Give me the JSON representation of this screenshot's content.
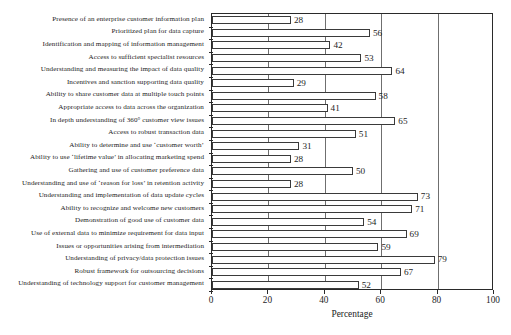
{
  "chart_data": {
    "type": "bar",
    "orientation": "horizontal",
    "title": "",
    "xlabel": "Percentage",
    "ylabel": "",
    "xlim": [
      0,
      100
    ],
    "xticks": [
      0,
      20,
      40,
      60,
      80,
      100
    ],
    "grid": true,
    "gridlines_at": [
      20,
      40,
      60,
      80
    ],
    "legend": false,
    "bar_style": {
      "fill": "#ffffff",
      "edge": "#3a3a3a"
    },
    "data_labels": true,
    "categories": [
      "Presence of an enterprise customer information plan",
      "Prioritized plan for data capture",
      "Identification and mapping of information management",
      "Access to sufficient specialist resources",
      "Understanding and measuring the impact of data quality",
      "Incentives and sanction supporting data quality",
      "Ability to share customer data at multiple touch points",
      "Appropriate access to data across the organization",
      "In depth understanding of 360° customer view issues",
      "Access to robust transaction data",
      "Ability to determine and use ‘customer worth’",
      "Ability to use ‘lifetime value’ in allocating marketing spend",
      "Gathering and use of customer preference data",
      "Understanding and use of ‘reason for loss’ in retention activity",
      "Understanding and implementation of data update cycles",
      "Ability to recognize and welcome new customers",
      "Demonstration of good use of customer data",
      "Use of external data to minimize requirement for data input",
      "Issues or opportunities arising from intermediation",
      "Understanding of privacy/data protection issues",
      "Robust framework for outsourcing decisions",
      "Understanding of technology support for customer management"
    ],
    "values": [
      28,
      56,
      42,
      53,
      64,
      29,
      58,
      41,
      65,
      51,
      31,
      28,
      50,
      28,
      73,
      71,
      54,
      69,
      59,
      79,
      67,
      52
    ]
  }
}
